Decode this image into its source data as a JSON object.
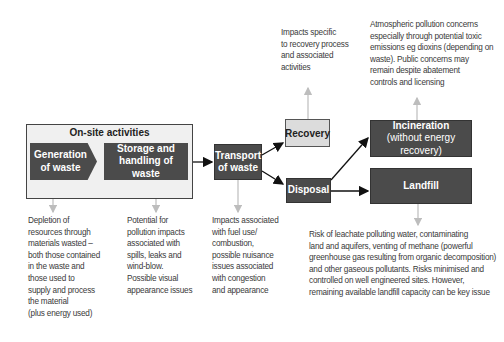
{
  "diagram": {
    "onsite": {
      "title": "On-site activities",
      "generation": {
        "line1": "Generation",
        "line2": "of waste"
      },
      "storage": {
        "line1": "Storage and",
        "line2": "handling of waste"
      }
    },
    "transport": {
      "line1": "Transport",
      "line2": "of waste"
    },
    "recovery": {
      "label": "Recovery"
    },
    "disposal": {
      "label": "Disposal"
    },
    "incineration": {
      "label": "Incineration",
      "sublabel": "(without energy recovery)"
    },
    "landfill": {
      "label": "Landfill"
    },
    "notes": {
      "recovery": [
        "Impacts specific",
        "to recovery process",
        "and associated",
        "activities"
      ],
      "incineration": [
        "Atmospheric pollution concerns",
        "especially through potential toxic",
        "emissions eg dioxins (depending on",
        "waste). Public concerns may",
        "remain despite abatement",
        "controls and licensing"
      ],
      "generation": [
        "Depletion of",
        "resources through",
        "materials wasted –",
        "both those contained",
        "in the waste and",
        "those used to",
        "supply and process",
        "the material",
        "(plus energy used)"
      ],
      "storage": [
        "Potential for",
        "pollution impacts",
        "associated with",
        "spills, leaks and",
        "wind-blow.",
        "Possible visual",
        "appearance issues"
      ],
      "transport": [
        "Impacts associated",
        "with fuel use/",
        "combustion,",
        "possible nuisance",
        "issues associated",
        "with congestion",
        "and appearance"
      ],
      "landfill": [
        "Risk of leachate polluting water, contaminating",
        "land and aquifers, venting of methane (powerful",
        "greenhouse gas resulting from organic decomposition)",
        "and other gaseous pollutants. Risks minimised and",
        "controlled on well engineered sites. However,",
        "remaining available landfill capacity can be key issue"
      ]
    },
    "colors": {
      "dark_box": "#4b4b4b",
      "light_box": "#dcdcdc",
      "onsite_bg": "#f0f0f0",
      "note_arrow": "#bdbdbd",
      "flow_arrow": "#111111"
    }
  }
}
